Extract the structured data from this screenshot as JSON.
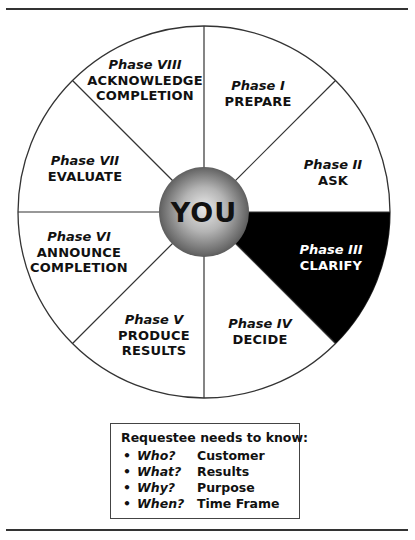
{
  "center": {
    "label": "YOU"
  },
  "phases": [
    {
      "phase": "Phase I",
      "name_lines": [
        "PREPARE"
      ],
      "highlighted": false
    },
    {
      "phase": "Phase II",
      "name_lines": [
        "ASK"
      ],
      "highlighted": false
    },
    {
      "phase": "Phase III",
      "name_lines": [
        "CLARIFY"
      ],
      "highlighted": true
    },
    {
      "phase": "Phase IV",
      "name_lines": [
        "DECIDE"
      ],
      "highlighted": false
    },
    {
      "phase": "Phase V",
      "name_lines": [
        "PRODUCE",
        "RESULTS"
      ],
      "highlighted": false
    },
    {
      "phase": "Phase VI",
      "name_lines": [
        "ANNOUNCE",
        "COMPLETION"
      ],
      "highlighted": false
    },
    {
      "phase": "Phase VII",
      "name_lines": [
        "EVALUATE"
      ],
      "highlighted": false
    },
    {
      "phase": "Phase VIII",
      "name_lines": [
        "ACKNOWLEDGE",
        "COMPLETION"
      ],
      "highlighted": false
    }
  ],
  "info_box": {
    "title": "Requestee needs to know:",
    "items": [
      {
        "bullet": "•",
        "question": "Who?",
        "answer": "Customer"
      },
      {
        "bullet": "•",
        "question": "What?",
        "answer": "Results"
      },
      {
        "bullet": "•",
        "question": "Why?",
        "answer": "Purpose"
      },
      {
        "bullet": "•",
        "question": "When?",
        "answer": "Time Frame"
      }
    ]
  },
  "colors": {
    "highlight": "#000000",
    "segment": "#ffffff",
    "outline": "#333333"
  }
}
